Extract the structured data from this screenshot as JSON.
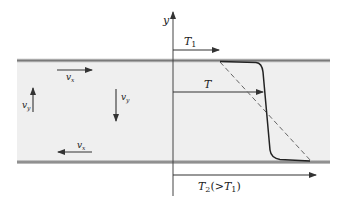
{
  "diagram": {
    "axis_label": "y",
    "arrows": {
      "T1": {
        "label": "T",
        "sub": "1"
      },
      "T": {
        "label": "T"
      },
      "T2": {
        "label": "T",
        "sub": "2",
        "suffix_open": "(>",
        "suffix_T": "T",
        "suffix_sub": "1",
        "suffix_close": ")"
      }
    },
    "velocities": {
      "vx_top": {
        "label": "v",
        "sub": "x"
      },
      "vx_bottom": {
        "label": "v",
        "sub": "x"
      },
      "vy_left": {
        "label": "v",
        "sub": "y"
      },
      "vy_right": {
        "label": "v",
        "sub": "y"
      }
    },
    "colors": {
      "fluid_layer": "#efefef",
      "wall": "#8a8a8a",
      "line": "#333333",
      "dashed": "#666666"
    }
  }
}
